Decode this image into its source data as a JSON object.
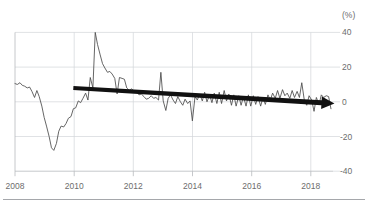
{
  "chart_data": {
    "type": "line",
    "title": "",
    "subtitle": "",
    "xlabel": "",
    "ylabel": "",
    "unit_label": "(%)",
    "grid": true,
    "legend_position": "none",
    "xlim": [
      2008.0,
      2018.9
    ],
    "ylim": [
      -40,
      40
    ],
    "xticks": [
      2008,
      2010,
      2012,
      2014,
      2016,
      2018
    ],
    "xtick_labels": [
      "2008",
      "2010",
      "2012",
      "2014",
      "2016",
      "2018"
    ],
    "yticks": [
      40,
      20,
      0,
      -20,
      -40
    ],
    "ytick_labels": [
      "40",
      "20",
      "0",
      "-20",
      "-40"
    ],
    "series": [
      {
        "name": "growth-rate",
        "color": "#4a4a4a",
        "x": [
          2008.0,
          2008.08,
          2008.17,
          2008.25,
          2008.33,
          2008.42,
          2008.5,
          2008.58,
          2008.67,
          2008.75,
          2008.83,
          2008.92,
          2009.0,
          2009.08,
          2009.17,
          2009.25,
          2009.33,
          2009.42,
          2009.5,
          2009.58,
          2009.67,
          2009.75,
          2009.83,
          2009.92,
          2010.0,
          2010.08,
          2010.17,
          2010.25,
          2010.33,
          2010.42,
          2010.5,
          2010.58,
          2010.67,
          2010.75,
          2010.83,
          2010.92,
          2011.0,
          2011.08,
          2011.17,
          2011.25,
          2011.33,
          2011.42,
          2011.5,
          2011.58,
          2011.67,
          2011.75,
          2011.83,
          2011.92,
          2012.0,
          2012.08,
          2012.17,
          2012.25,
          2012.33,
          2012.42,
          2012.5,
          2012.58,
          2012.67,
          2012.75,
          2012.83,
          2012.92,
          2013.0,
          2013.08,
          2013.17,
          2013.25,
          2013.33,
          2013.42,
          2013.5,
          2013.58,
          2013.67,
          2013.75,
          2013.83,
          2013.92,
          2014.0,
          2014.08,
          2014.17,
          2014.25,
          2014.33,
          2014.42,
          2014.5,
          2014.58,
          2014.67,
          2014.75,
          2014.83,
          2014.92,
          2015.0,
          2015.08,
          2015.17,
          2015.25,
          2015.33,
          2015.42,
          2015.5,
          2015.58,
          2015.67,
          2015.75,
          2015.83,
          2015.92,
          2016.0,
          2016.08,
          2016.17,
          2016.25,
          2016.33,
          2016.42,
          2016.5,
          2016.58,
          2016.67,
          2016.75,
          2016.83,
          2016.92,
          2017.0,
          2017.08,
          2017.17,
          2017.25,
          2017.33,
          2017.42,
          2017.5,
          2017.58,
          2017.67,
          2017.75,
          2017.83,
          2017.92,
          2018.0,
          2018.08,
          2018.17,
          2018.25,
          2018.33,
          2018.42,
          2018.5,
          2018.58,
          2018.67,
          2018.75,
          2018.83
        ],
        "y": [
          10.5,
          10.0,
          11.0,
          9.5,
          9.0,
          8.0,
          8.5,
          6.0,
          2.5,
          6.5,
          3.0,
          -2.5,
          -9.0,
          -14.0,
          -20.0,
          -26.5,
          -28.0,
          -24.0,
          -17.0,
          -14.0,
          -14.5,
          -12.5,
          -9.5,
          -8.5,
          -4.0,
          -3.5,
          0.5,
          -0.5,
          2.0,
          5.0,
          1.0,
          14.0,
          8.0,
          40.0,
          33.0,
          27.0,
          22.0,
          19.5,
          17.0,
          17.5,
          16.0,
          13.5,
          4.5,
          14.0,
          13.5,
          13.0,
          8.0,
          6.5,
          7.5,
          6.0,
          5.5,
          4.0,
          4.5,
          3.0,
          1.5,
          2.0,
          3.5,
          2.0,
          2.5,
          1.0,
          17.0,
          0.5,
          -5.0,
          2.0,
          4.0,
          1.0,
          -1.0,
          3.0,
          0.0,
          -2.0,
          1.5,
          -1.0,
          0.5,
          -11.0,
          3.0,
          1.0,
          4.5,
          0.5,
          5.5,
          0.0,
          4.0,
          -0.5,
          5.0,
          -1.0,
          5.5,
          -1.0,
          6.5,
          0.5,
          4.5,
          -2.0,
          4.0,
          -2.5,
          3.5,
          -2.0,
          3.0,
          -2.5,
          4.0,
          -2.5,
          3.5,
          -1.5,
          3.0,
          -2.5,
          2.5,
          -1.5,
          4.0,
          1.0,
          5.0,
          2.0,
          6.5,
          2.0,
          7.0,
          3.5,
          5.0,
          2.0,
          6.5,
          2.5,
          6.0,
          2.5,
          11.0,
          0.5,
          -2.0,
          3.5,
          1.0,
          -5.5,
          2.5,
          -1.5,
          4.0,
          2.5,
          3.5,
          3.0,
          -4.0
        ]
      }
    ],
    "annotations": [
      {
        "type": "arrow",
        "name": "downward-trend-arrow",
        "color": "#111111",
        "x_start": 2010.0,
        "y_start": 8.0,
        "x_end": 2018.95,
        "y_end": -1.0,
        "description": "thick black arrow indicating declining trend"
      }
    ]
  }
}
